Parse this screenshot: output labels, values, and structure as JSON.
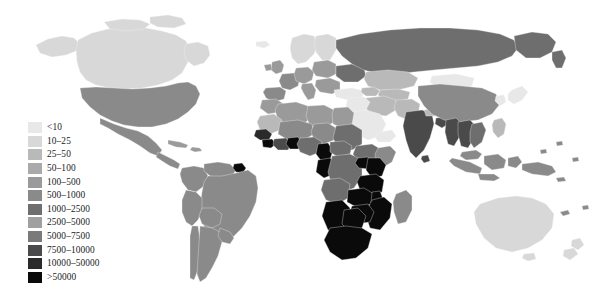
{
  "figure": {
    "type": "choropleth-world-map",
    "projection": "equirectangular",
    "background_color": "#ffffff",
    "no_data_color": "#ffffff",
    "border_color": "#f2f2f2"
  },
  "legend": {
    "name": "legend",
    "position": "left-lower",
    "items": [
      {
        "label": "<10",
        "color": "#e8e8e8",
        "min": 0,
        "max": 10
      },
      {
        "label": "10–25",
        "color": "#d8d8d8",
        "min": 10,
        "max": 25
      },
      {
        "label": "25–50",
        "color": "#b9b9b9",
        "min": 25,
        "max": 50
      },
      {
        "label": "50–100",
        "color": "#aaaaaa",
        "min": 50,
        "max": 100
      },
      {
        "label": "100–500",
        "color": "#9a9a9a",
        "min": 100,
        "max": 500
      },
      {
        "label": "500–1000",
        "color": "#8a8a8a",
        "min": 500,
        "max": 1000
      },
      {
        "label": "1000–2500",
        "color": "#6e6e6e",
        "min": 1000,
        "max": 2500
      },
      {
        "label": "2500–5000",
        "color": "#a0a0a0",
        "min": 2500,
        "max": 5000
      },
      {
        "label": "5000–7500",
        "color": "#7a7a7a",
        "min": 5000,
        "max": 7500
      },
      {
        "label": "7500–10000",
        "color": "#4a4a4a",
        "min": 7500,
        "max": 10000
      },
      {
        "label": "10000–50000",
        "color": "#2a2a2a",
        "min": 10000,
        "max": 50000
      },
      {
        "label": ">50000",
        "color": "#0a0a0a",
        "min": 50000,
        "max": null
      }
    ]
  },
  "chart_data": {
    "type": "heatmap",
    "title": "",
    "xlabel": "",
    "ylabel": "",
    "legend_position": "left",
    "grid": false,
    "categories": [
      "<10",
      "10–25",
      "25–50",
      "50–100",
      "100–500",
      "500–1000",
      "1000–2500",
      "2500–5000",
      "5000–7500",
      "7500–10000",
      "10000–50000",
      ">50000"
    ],
    "regions": [
      {
        "name": "Canada",
        "class": "10–25",
        "color": "#d8d8d8"
      },
      {
        "name": "United States",
        "class": "500–1000",
        "color": "#8a8a8a"
      },
      {
        "name": "Greenland",
        "class": "no-data",
        "color": "#ffffff"
      },
      {
        "name": "Mexico",
        "class": "500–1000",
        "color": "#8a8a8a"
      },
      {
        "name": "Central America",
        "class": "500–1000",
        "color": "#8a8a8a"
      },
      {
        "name": "Cuba",
        "class": "100–500",
        "color": "#9a9a9a"
      },
      {
        "name": "Brazil",
        "class": "500–1000",
        "color": "#8a8a8a"
      },
      {
        "name": "Argentina",
        "class": "500–1000",
        "color": "#8a8a8a"
      },
      {
        "name": "Colombia",
        "class": "500–1000",
        "color": "#8a8a8a"
      },
      {
        "name": "Peru",
        "class": "500–1000",
        "color": "#8a8a8a"
      },
      {
        "name": "Venezuela",
        "class": "500–1000",
        "color": "#8a8a8a"
      },
      {
        "name": "Guyana",
        "class": ">50000",
        "color": "#0a0a0a"
      },
      {
        "name": "Chile",
        "class": "500–1000",
        "color": "#8a8a8a"
      },
      {
        "name": "United Kingdom",
        "class": "100–500",
        "color": "#9a9a9a"
      },
      {
        "name": "France",
        "class": "500–1000",
        "color": "#8a8a8a"
      },
      {
        "name": "Spain",
        "class": "500–1000",
        "color": "#8a8a8a"
      },
      {
        "name": "Germany",
        "class": "100–500",
        "color": "#9a9a9a"
      },
      {
        "name": "Scandinavia",
        "class": "10–25",
        "color": "#d8d8d8"
      },
      {
        "name": "Eastern Europe",
        "class": "100–500",
        "color": "#9a9a9a"
      },
      {
        "name": "Ukraine",
        "class": "1000–2500",
        "color": "#6e6e6e"
      },
      {
        "name": "Russia",
        "class": "1000–2500",
        "color": "#6e6e6e"
      },
      {
        "name": "Kazakhstan",
        "class": "25–50",
        "color": "#b9b9b9"
      },
      {
        "name": "Central Asia",
        "class": "25–50",
        "color": "#b9b9b9"
      },
      {
        "name": "Turkey",
        "class": "<10",
        "color": "#e8e8e8"
      },
      {
        "name": "Saudi Arabia",
        "class": "<10",
        "color": "#e8e8e8"
      },
      {
        "name": "Iran",
        "class": "25–50",
        "color": "#b9b9b9"
      },
      {
        "name": "Morocco",
        "class": "100–500",
        "color": "#9a9a9a"
      },
      {
        "name": "Algeria",
        "class": "100–500",
        "color": "#9a9a9a"
      },
      {
        "name": "Libya",
        "class": "100–500",
        "color": "#9a9a9a"
      },
      {
        "name": "Egypt",
        "class": "100–500",
        "color": "#9a9a9a"
      },
      {
        "name": "Sudan",
        "class": "1000–2500",
        "color": "#6e6e6e"
      },
      {
        "name": "Ethiopia",
        "class": "1000–2500",
        "color": "#6e6e6e"
      },
      {
        "name": "Nigeria",
        "class": "1000–2500",
        "color": "#6e6e6e"
      },
      {
        "name": "Ghana",
        "class": ">50000",
        "color": "#0a0a0a"
      },
      {
        "name": "Ivory Coast",
        "class": "7500–10000",
        "color": "#4a4a4a"
      },
      {
        "name": "Cameroon",
        "class": ">50000",
        "color": "#0a0a0a"
      },
      {
        "name": "Gabon",
        "class": ">50000",
        "color": "#0a0a0a"
      },
      {
        "name": "DR Congo",
        "class": "1000–2500",
        "color": "#6e6e6e"
      },
      {
        "name": "Kenya",
        "class": ">50000",
        "color": "#0a0a0a"
      },
      {
        "name": "Tanzania",
        "class": ">50000",
        "color": "#0a0a0a"
      },
      {
        "name": "Uganda",
        "class": ">50000",
        "color": "#0a0a0a"
      },
      {
        "name": "Angola",
        "class": "1000–2500",
        "color": "#6e6e6e"
      },
      {
        "name": "Zambia",
        "class": ">50000",
        "color": "#0a0a0a"
      },
      {
        "name": "Zimbabwe",
        "class": ">50000",
        "color": "#0a0a0a"
      },
      {
        "name": "Mozambique",
        "class": ">50000",
        "color": "#0a0a0a"
      },
      {
        "name": "Botswana",
        "class": ">50000",
        "color": "#0a0a0a"
      },
      {
        "name": "Namibia",
        "class": ">50000",
        "color": "#0a0a0a"
      },
      {
        "name": "South Africa",
        "class": ">50000",
        "color": "#0a0a0a"
      },
      {
        "name": "Madagascar",
        "class": "500–1000",
        "color": "#8a8a8a"
      },
      {
        "name": "India",
        "class": "7500–10000",
        "color": "#4a4a4a"
      },
      {
        "name": "Pakistan",
        "class": "25–50",
        "color": "#b9b9b9"
      },
      {
        "name": "China",
        "class": "500–1000",
        "color": "#8a8a8a"
      },
      {
        "name": "Mongolia",
        "class": "<10",
        "color": "#e8e8e8"
      },
      {
        "name": "Myanmar",
        "class": "7500–10000",
        "color": "#4a4a4a"
      },
      {
        "name": "Thailand",
        "class": "7500–10000",
        "color": "#4a4a4a"
      },
      {
        "name": "Vietnam",
        "class": "1000–2500",
        "color": "#6e6e6e"
      },
      {
        "name": "Indonesia",
        "class": "500–1000",
        "color": "#8a8a8a"
      },
      {
        "name": "Japan",
        "class": "<10",
        "color": "#e8e8e8"
      },
      {
        "name": "Papua New Guinea",
        "class": "500–1000",
        "color": "#8a8a8a"
      },
      {
        "name": "Australia",
        "class": "10–25",
        "color": "#d8d8d8"
      },
      {
        "name": "New Zealand",
        "class": "10–25",
        "color": "#d8d8d8"
      }
    ]
  }
}
